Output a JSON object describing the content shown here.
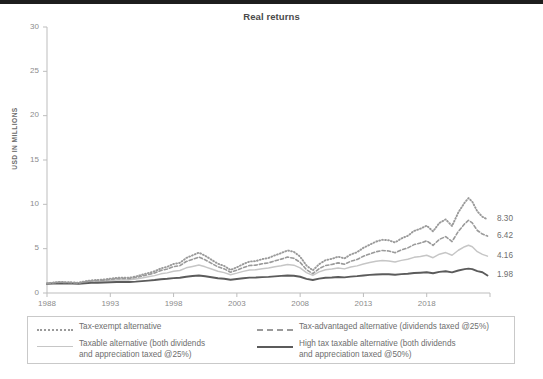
{
  "title": "Real returns",
  "topbar_color": "#1d1d1d",
  "axes": {
    "ylabel": "USD IN MILLIONS",
    "yticks": [
      0,
      5,
      10,
      15,
      20,
      25,
      30
    ],
    "xticks": [
      1988,
      1993,
      1998,
      2003,
      2008,
      2013,
      2018
    ]
  },
  "end_labels": [
    {
      "value": "8.30",
      "series": "Tax-exempt alternative"
    },
    {
      "value": "6.42",
      "series": "Tax-advantaged alternative (dividends taxed @25%)"
    },
    {
      "value": "4.16",
      "series": "Taxable alternative (both dividends and appreciation taxed @25%)"
    },
    {
      "value": "1.98",
      "series": "High tax taxable alternative (both dividends and appreciation taxed @50%)"
    }
  ],
  "legend": {
    "items": [
      {
        "label": "Tax-exempt alternative",
        "style": "dotted",
        "color": "#9a9a9a"
      },
      {
        "label": "Tax-advantaged alternative (dividends taxed @25%)",
        "style": "dashed",
        "color": "#9a9a9a"
      },
      {
        "label": "Taxable alternative (both dividends\nand appreciation taxed @25%)",
        "style": "solid",
        "color": "#c6c6c6"
      },
      {
        "label": "High tax taxable alternative (both dividends\nand appreciation taxed @50%)",
        "style": "solid",
        "color": "#5b5b5b"
      }
    ]
  },
  "chart_data": {
    "type": "line",
    "title": "Real returns",
    "xlabel": "",
    "ylabel": "USD IN MILLIONS",
    "xlim": [
      1988,
      2023
    ],
    "ylim": [
      0,
      30
    ],
    "grid": false,
    "legend_position": "bottom",
    "xticks": [
      1988,
      1993,
      1998,
      2003,
      2008,
      2013,
      2018
    ],
    "yticks": [
      0,
      5,
      10,
      15,
      20,
      25,
      30
    ],
    "x": [
      1988,
      1988.5,
      1989,
      1989.5,
      1990,
      1990.5,
      1991,
      1991.5,
      1992,
      1992.5,
      1993,
      1993.5,
      1994,
      1994.5,
      1995,
      1995.5,
      1996,
      1996.5,
      1997,
      1997.5,
      1998,
      1998.5,
      1999,
      1999.5,
      2000,
      2000.5,
      2001,
      2001.5,
      2002,
      2002.5,
      2003,
      2003.5,
      2004,
      2004.5,
      2005,
      2005.5,
      2006,
      2006.5,
      2007,
      2007.5,
      2008,
      2008.5,
      2009,
      2009.5,
      2010,
      2010.5,
      2011,
      2011.5,
      2012,
      2012.5,
      2013,
      2013.5,
      2014,
      2014.5,
      2015,
      2015.5,
      2016,
      2016.5,
      2017,
      2017.5,
      2018,
      2018.5,
      2019,
      2019.5,
      2020,
      2020.5,
      2021,
      2021.3,
      2021.6,
      2022,
      2022.4,
      2022.8
    ],
    "series": [
      {
        "name": "Tax-exempt alternative",
        "style": "dotted",
        "color": "#9a9a9a",
        "end_value": 8.3,
        "values": [
          1.1,
          1.18,
          1.26,
          1.22,
          1.2,
          1.16,
          1.32,
          1.42,
          1.48,
          1.52,
          1.62,
          1.7,
          1.74,
          1.72,
          1.86,
          2.05,
          2.25,
          2.45,
          2.78,
          2.95,
          3.28,
          3.4,
          3.95,
          4.25,
          4.55,
          4.2,
          3.75,
          3.3,
          3.05,
          2.6,
          2.9,
          3.25,
          3.55,
          3.6,
          3.82,
          3.95,
          4.25,
          4.5,
          4.8,
          4.65,
          4.1,
          3.1,
          2.55,
          3.25,
          3.7,
          3.85,
          4.1,
          3.9,
          4.35,
          4.6,
          5.1,
          5.45,
          5.8,
          6.0,
          5.95,
          5.7,
          6.15,
          6.45,
          7.0,
          7.25,
          7.6,
          6.95,
          7.9,
          8.3,
          7.55,
          9.1,
          10.2,
          10.7,
          10.3,
          9.2,
          8.6,
          8.3
        ]
      },
      {
        "name": "Tax-advantaged alternative (dividends taxed @25%)",
        "style": "dashed",
        "color": "#9a9a9a",
        "end_value": 6.42,
        "values": [
          1.08,
          1.15,
          1.22,
          1.19,
          1.17,
          1.13,
          1.27,
          1.36,
          1.41,
          1.45,
          1.54,
          1.61,
          1.64,
          1.62,
          1.74,
          1.91,
          2.08,
          2.26,
          2.55,
          2.7,
          2.98,
          3.08,
          3.55,
          3.8,
          4.05,
          3.74,
          3.34,
          2.95,
          2.72,
          2.34,
          2.58,
          2.86,
          3.1,
          3.14,
          3.3,
          3.4,
          3.62,
          3.82,
          4.05,
          3.92,
          3.46,
          2.63,
          2.18,
          2.74,
          3.1,
          3.22,
          3.4,
          3.24,
          3.58,
          3.78,
          4.15,
          4.4,
          4.65,
          4.8,
          4.74,
          4.54,
          4.86,
          5.08,
          5.46,
          5.64,
          5.88,
          5.38,
          6.05,
          6.36,
          5.8,
          6.95,
          7.8,
          8.2,
          7.9,
          7.05,
          6.65,
          6.42
        ]
      },
      {
        "name": "Taxable alternative (both dividends and appreciation taxed @25%)",
        "style": "solid",
        "color": "#c6c6c6",
        "end_value": 4.16,
        "values": [
          1.06,
          1.12,
          1.17,
          1.15,
          1.13,
          1.1,
          1.21,
          1.28,
          1.32,
          1.35,
          1.42,
          1.47,
          1.5,
          1.48,
          1.57,
          1.7,
          1.83,
          1.96,
          2.16,
          2.27,
          2.46,
          2.54,
          2.84,
          3.0,
          3.15,
          2.95,
          2.7,
          2.45,
          2.3,
          2.06,
          2.24,
          2.44,
          2.6,
          2.63,
          2.74,
          2.82,
          2.96,
          3.08,
          3.22,
          3.14,
          2.84,
          2.3,
          1.98,
          2.38,
          2.62,
          2.7,
          2.82,
          2.72,
          2.94,
          3.06,
          3.28,
          3.44,
          3.58,
          3.66,
          3.62,
          3.5,
          3.68,
          3.8,
          4.02,
          4.12,
          4.26,
          3.98,
          4.38,
          4.56,
          4.26,
          4.82,
          5.22,
          5.38,
          5.22,
          4.66,
          4.36,
          4.16
        ]
      },
      {
        "name": "High tax taxable alternative (both dividends and appreciation taxed @50%)",
        "style": "solid",
        "color": "#5b5b5b",
        "end_value": 1.98,
        "values": [
          1.03,
          1.06,
          1.08,
          1.07,
          1.06,
          1.05,
          1.1,
          1.14,
          1.16,
          1.18,
          1.21,
          1.24,
          1.25,
          1.24,
          1.28,
          1.34,
          1.4,
          1.46,
          1.55,
          1.6,
          1.68,
          1.72,
          1.84,
          1.91,
          1.97,
          1.89,
          1.78,
          1.67,
          1.61,
          1.5,
          1.58,
          1.66,
          1.73,
          1.74,
          1.79,
          1.82,
          1.88,
          1.93,
          1.98,
          1.95,
          1.83,
          1.6,
          1.46,
          1.62,
          1.72,
          1.75,
          1.8,
          1.76,
          1.85,
          1.9,
          1.98,
          2.04,
          2.09,
          2.12,
          2.11,
          2.06,
          2.13,
          2.17,
          2.25,
          2.29,
          2.34,
          2.23,
          2.38,
          2.45,
          2.33,
          2.54,
          2.69,
          2.75,
          2.69,
          2.46,
          2.34,
          1.98
        ]
      }
    ]
  }
}
